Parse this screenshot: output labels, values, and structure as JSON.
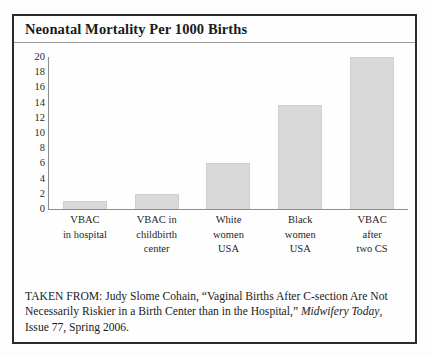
{
  "figure": {
    "title": "Neonatal Mortality Per 1000 Births"
  },
  "caption": {
    "line1": "TAKEN FROM: Judy Slome Cohain, “Vaginal Births After C-section",
    "line2": "Are Not Necessarily Riskier in a Birth Center than in the Hospital,”",
    "journal": "Midwifery Today",
    "line3_rest": ", Issue 77, Spring 2006."
  },
  "chart_data": {
    "type": "bar",
    "title": "Neonatal Mortality Per 1000 Births",
    "xlabel": "",
    "ylabel": "",
    "ylim": [
      0,
      20
    ],
    "yticks": [
      20,
      18,
      16,
      14,
      12,
      10,
      8,
      6,
      4,
      2,
      0
    ],
    "grid": false,
    "legend": false,
    "bar_color": "#d9d9d9",
    "categories": [
      "VBAC in hospital",
      "VBAC in childbirth center",
      "White women USA",
      "Black women USA",
      "VBAC after two CS"
    ],
    "category_lines": [
      [
        "VBAC",
        "in hospital"
      ],
      [
        "VBAC in",
        "childbirth",
        "center"
      ],
      [
        "White",
        "women",
        "USA"
      ],
      [
        "Black",
        "women",
        "USA"
      ],
      [
        "VBAC",
        "after",
        "two CS"
      ]
    ],
    "values": [
      1,
      2,
      6,
      13.7,
      20
    ]
  }
}
